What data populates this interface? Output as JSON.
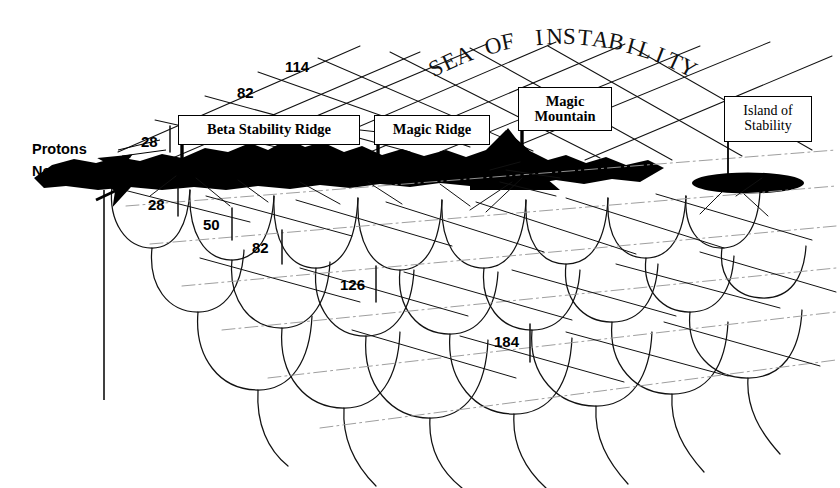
{
  "figure": {
    "background_color": "#ffffff",
    "ink_color": "#000000"
  },
  "axes": {
    "protons_label": "Protons",
    "neutrons_label": "Neutrons"
  },
  "callouts": [
    {
      "id": "beta-stability-ridge",
      "text": "Beta Stability Ridge",
      "style": "bold",
      "x": 178,
      "y": 115,
      "w": 182,
      "h": 30,
      "font_size": 14.5
    },
    {
      "id": "magic-ridge",
      "text": "Magic Ridge",
      "style": "bold",
      "x": 374,
      "y": 115,
      "w": 116,
      "h": 30,
      "font_size": 14.5
    },
    {
      "id": "magic-mountain",
      "text": "Magic\nMountain",
      "style": "bold",
      "x": 518,
      "y": 87,
      "w": 94,
      "h": 44,
      "font_size": 14.5
    },
    {
      "id": "island-of-stability",
      "text": "Island of\nStability",
      "style": "thin",
      "x": 724,
      "y": 96,
      "w": 88,
      "h": 46,
      "font_size": 14
    }
  ],
  "magic_numbers": [
    {
      "id": "upper-114",
      "value": "114",
      "x": 285,
      "y": 58,
      "font_size": 15
    },
    {
      "id": "upper-82",
      "value": "82",
      "x": 237,
      "y": 84,
      "font_size": 15
    },
    {
      "id": "proton-28",
      "value": "28",
      "x": 141,
      "y": 133,
      "font_size": 15
    },
    {
      "id": "lower-28",
      "value": "28",
      "x": 148,
      "y": 196,
      "font_size": 15
    },
    {
      "id": "lower-50",
      "value": "50",
      "x": 203,
      "y": 216,
      "font_size": 15
    },
    {
      "id": "lower-82",
      "value": "82",
      "x": 252,
      "y": 239,
      "font_size": 15
    },
    {
      "id": "lower-126",
      "value": "126",
      "x": 340,
      "y": 276,
      "font_size": 15
    },
    {
      "id": "lower-184",
      "value": "184",
      "x": 494,
      "y": 333,
      "font_size": 15
    }
  ],
  "chart_data": {
    "type": "diagram",
    "xlabel": "Neutrons",
    "ylabel": "Protons",
    "features": [
      "Beta Stability Ridge",
      "Magic Ridge",
      "Magic Mountain",
      "Island of Stability"
    ],
    "magic_numbers_upper": [
      28,
      82,
      114
    ],
    "magic_numbers_lower": [
      28,
      50,
      82,
      126,
      184
    ],
    "legend": "none",
    "grid": "perspective lattice"
  }
}
